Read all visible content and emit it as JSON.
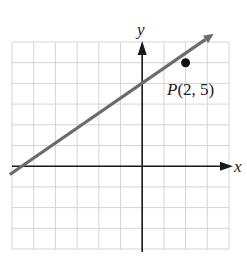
{
  "chart_data": {
    "type": "line",
    "title": "",
    "xlabel": "x",
    "ylabel": "y",
    "xlim": [
      -6,
      4
    ],
    "ylim": [
      -4,
      6
    ],
    "grid": true,
    "grid_step": 1,
    "series": [
      {
        "name": "line through P",
        "x": [
          -6.1,
          3.3
        ],
        "y": [
          -0.4,
          6.4
        ],
        "color": "#6b6b6b",
        "arrow_end": true
      }
    ],
    "points": [
      {
        "label": "P(2, 5)",
        "x": 2,
        "y": 5
      }
    ]
  },
  "axes": {
    "x_label": "x",
    "y_label": "y"
  },
  "point": {
    "name": "P",
    "label": "P(2, 5)",
    "label_prefix": "P",
    "label_coords": "(2, 5)"
  },
  "colors": {
    "grid": "#d4d4d4",
    "axis": "#1a1a1a",
    "line": "#6b6b6b",
    "point": "#111111"
  }
}
